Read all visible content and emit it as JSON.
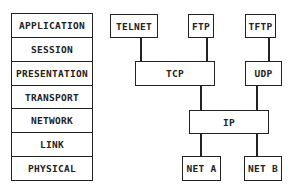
{
  "osi_layers": [
    "APPLICATION",
    "SESSION",
    "PRESENTATION",
    "TRANSPORT",
    "NETWORK",
    "LINK",
    "PHYSICAL"
  ],
  "protocols": {
    "telnet": "TELNET",
    "ftp": "FTP",
    "tftp": "TFTP",
    "tcp": "TCP",
    "udp": "UDP",
    "ip": "IP",
    "net_a": "NET A",
    "net_b": "NET B"
  },
  "connections": [
    [
      "TELNET",
      "TCP"
    ],
    [
      "FTP",
      "TCP"
    ],
    [
      "TFTP",
      "UDP"
    ],
    [
      "TCP",
      "IP"
    ],
    [
      "UDP",
      "IP"
    ],
    [
      "IP",
      "NET A"
    ],
    [
      "IP",
      "NET B"
    ]
  ]
}
